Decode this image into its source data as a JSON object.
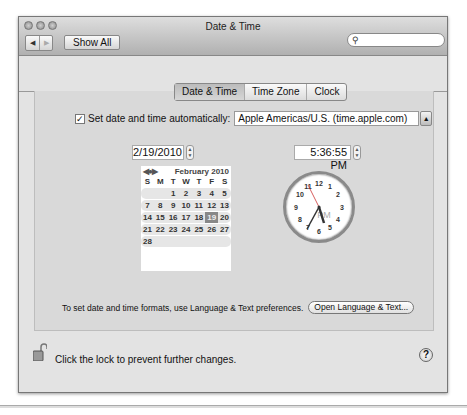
{
  "window": {
    "title": "Date & Time"
  },
  "toolbar": {
    "back_icon": "◀",
    "forward_icon": "▶",
    "show_all_label": "Show All",
    "search_placeholder": "",
    "search_icon": "🔍"
  },
  "tabs": [
    {
      "label": "Date & Time",
      "active": true
    },
    {
      "label": "Time Zone",
      "active": false
    },
    {
      "label": "Clock",
      "active": false
    }
  ],
  "auto": {
    "checked": true,
    "check_glyph": "✓",
    "label": "Set date and time automatically:",
    "server": "Apple Americas/U.S. (time.apple.com)",
    "arrow": "▲▼"
  },
  "date_field": {
    "value": "2/19/2010"
  },
  "time_field": {
    "value": "5:36:55 PM"
  },
  "calendar": {
    "nav_glyphs": "◀●▶",
    "month_label": "February 2010",
    "dow": [
      "S",
      "M",
      "T",
      "W",
      "T",
      "F",
      "S"
    ],
    "weeks": [
      [
        "",
        "",
        "1",
        "2",
        "3",
        "4",
        "5",
        "6"
      ],
      [
        "7",
        "8",
        "9",
        "10",
        "11",
        "12",
        "13"
      ],
      [
        "14",
        "15",
        "16",
        "17",
        "18",
        "19",
        "20"
      ],
      [
        "21",
        "22",
        "23",
        "24",
        "25",
        "26",
        "27"
      ],
      [
        "28",
        "",
        "",
        "",
        "",
        "",
        ""
      ]
    ],
    "selected_day": "19"
  },
  "clock": {
    "ampm": "PM",
    "hour": 5,
    "minute": 36,
    "second": 55
  },
  "hint": {
    "text": "To set date and time formats, use Language & Text preferences.",
    "button_label": "Open Language & Text..."
  },
  "footer": {
    "lock_label": "Click the lock to prevent further changes.",
    "help_glyph": "?"
  }
}
